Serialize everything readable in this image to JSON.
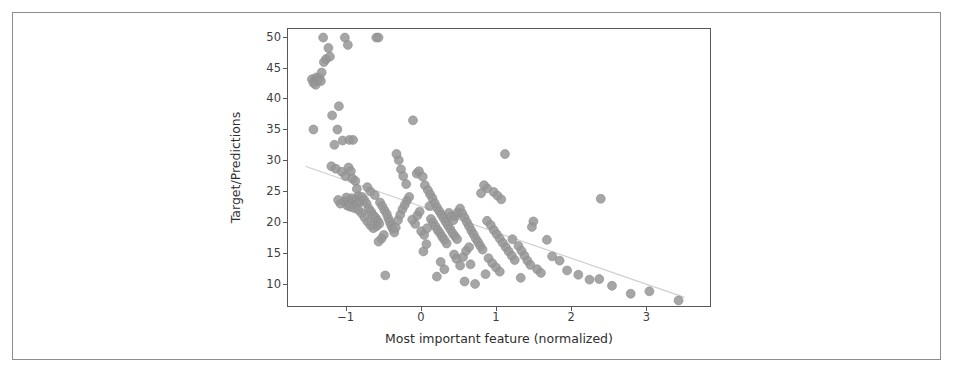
{
  "figure": {
    "background_color": "#ffffff",
    "frame_color": "#8d8d8d",
    "axes_edge_color": "#585858"
  },
  "chart_data": {
    "type": "scatter",
    "title": "",
    "xlabel": "Most important feature (normalized)",
    "ylabel": "Target/Predictions",
    "xlim": [
      -1.78,
      3.86
    ],
    "ylim": [
      6.2,
      51.4
    ],
    "xticks": [
      -1,
      0,
      1,
      2,
      3
    ],
    "xtick_labels": [
      "−1",
      "0",
      "1",
      "2",
      "3"
    ],
    "yticks": [
      10,
      15,
      20,
      25,
      30,
      35,
      40,
      45,
      50
    ],
    "ytick_labels": [
      "10",
      "15",
      "20",
      "25",
      "30",
      "35",
      "40",
      "45",
      "50"
    ],
    "grid": false,
    "legend": null,
    "marker": {
      "shape": "circle",
      "color": "#979797",
      "edge_color": "#8a8a8a",
      "size_px": 9,
      "opacity": 0.85
    },
    "trendline": {
      "type": "line",
      "color": "#cfcfcf",
      "width_px": 1.2,
      "x": [
        -1.55,
        3.52
      ],
      "y": [
        29.0,
        7.6
      ]
    },
    "series": [
      {
        "name": "Target/Predictions",
        "points": [
          [
            -1.44,
            35.0
          ],
          [
            -1.46,
            43.2
          ],
          [
            -1.44,
            42.6
          ],
          [
            -1.42,
            43.1
          ],
          [
            -1.4,
            43.5
          ],
          [
            -1.41,
            42.3
          ],
          [
            -1.38,
            43.0
          ],
          [
            -1.36,
            43.4
          ],
          [
            -1.34,
            42.9
          ],
          [
            -1.33,
            44.3
          ],
          [
            -1.3,
            46.0
          ],
          [
            -1.27,
            46.5
          ],
          [
            -1.31,
            50.0
          ],
          [
            -1.24,
            48.3
          ],
          [
            -1.22,
            46.9
          ],
          [
            -1.19,
            37.3
          ],
          [
            -1.16,
            32.5
          ],
          [
            -1.12,
            35.0
          ],
          [
            -1.1,
            38.8
          ],
          [
            -1.05,
            33.2
          ],
          [
            -1.02,
            50.0
          ],
          [
            -0.98,
            48.8
          ],
          [
            -0.96,
            33.3
          ],
          [
            -0.91,
            33.3
          ],
          [
            -1.2,
            29.0
          ],
          [
            -1.14,
            28.6
          ],
          [
            -1.06,
            28.1
          ],
          [
            -1.01,
            27.4
          ],
          [
            -0.97,
            28.8
          ],
          [
            -0.94,
            28.2
          ],
          [
            -0.92,
            27.0
          ],
          [
            -0.88,
            26.6
          ],
          [
            -0.86,
            25.3
          ],
          [
            -0.84,
            24.1
          ],
          [
            -0.88,
            23.6
          ],
          [
            -0.93,
            23.8
          ],
          [
            -0.97,
            23.4
          ],
          [
            -1.0,
            23.9
          ],
          [
            -1.03,
            23.2
          ],
          [
            -0.99,
            22.6
          ],
          [
            -0.95,
            22.4
          ],
          [
            -0.9,
            22.2
          ],
          [
            -0.86,
            22.8
          ],
          [
            -0.82,
            23.2
          ],
          [
            -0.79,
            24.0
          ],
          [
            -0.76,
            23.5
          ],
          [
            -0.73,
            22.9
          ],
          [
            -0.7,
            22.1
          ],
          [
            -0.67,
            21.6
          ],
          [
            -0.64,
            21.0
          ],
          [
            -0.61,
            20.6
          ],
          [
            -0.58,
            20.1
          ],
          [
            -0.56,
            19.6
          ],
          [
            -0.6,
            19.2
          ],
          [
            -0.64,
            18.9
          ],
          [
            -0.68,
            19.4
          ],
          [
            -0.72,
            20.0
          ],
          [
            -0.76,
            20.7
          ],
          [
            -0.8,
            21.4
          ],
          [
            -0.84,
            21.9
          ],
          [
            -0.55,
            23.1
          ],
          [
            -0.52,
            22.5
          ],
          [
            -0.49,
            21.8
          ],
          [
            -0.46,
            21.2
          ],
          [
            -0.44,
            20.5
          ],
          [
            -0.42,
            19.9
          ],
          [
            -0.4,
            19.3
          ],
          [
            -0.38,
            18.8
          ],
          [
            -0.36,
            18.2
          ],
          [
            -0.34,
            19.0
          ],
          [
            -0.31,
            20.2
          ],
          [
            -0.28,
            21.1
          ],
          [
            -0.25,
            22.0
          ],
          [
            -0.22,
            22.7
          ],
          [
            -0.19,
            23.4
          ],
          [
            -0.16,
            24.0
          ],
          [
            -0.3,
            30.0
          ],
          [
            -0.27,
            28.5
          ],
          [
            -0.24,
            27.4
          ],
          [
            -0.2,
            26.1
          ],
          [
            -0.33,
            31.0
          ],
          [
            -0.11,
            36.5
          ],
          [
            -0.06,
            27.8
          ],
          [
            -0.03,
            28.2
          ],
          [
            0.02,
            27.3
          ],
          [
            0.05,
            25.9
          ],
          [
            0.09,
            25.1
          ],
          [
            0.12,
            24.4
          ],
          [
            0.15,
            23.8
          ],
          [
            0.18,
            23.0
          ],
          [
            0.21,
            22.3
          ],
          [
            0.24,
            21.7
          ],
          [
            0.27,
            21.1
          ],
          [
            0.3,
            20.5
          ],
          [
            0.33,
            19.9
          ],
          [
            0.36,
            19.3
          ],
          [
            0.39,
            18.7
          ],
          [
            0.42,
            18.1
          ],
          [
            0.45,
            17.6
          ],
          [
            0.48,
            17.1
          ],
          [
            0.13,
            20.4
          ],
          [
            0.16,
            19.8
          ],
          [
            0.19,
            19.2
          ],
          [
            0.22,
            18.6
          ],
          [
            0.25,
            18.1
          ],
          [
            0.28,
            17.5
          ],
          [
            0.31,
            17.0
          ],
          [
            0.34,
            16.4
          ],
          [
            0.37,
            21.4
          ],
          [
            0.4,
            20.8
          ],
          [
            0.43,
            20.2
          ],
          [
            0.46,
            20.9
          ],
          [
            0.49,
            21.5
          ],
          [
            0.52,
            22.1
          ],
          [
            0.55,
            21.3
          ],
          [
            0.58,
            20.6
          ],
          [
            0.61,
            19.9
          ],
          [
            0.64,
            19.2
          ],
          [
            0.67,
            18.5
          ],
          [
            0.7,
            17.9
          ],
          [
            0.73,
            17.2
          ],
          [
            0.76,
            16.6
          ],
          [
            0.79,
            16.0
          ],
          [
            0.82,
            15.4
          ],
          [
            0.44,
            14.6
          ],
          [
            0.47,
            13.9
          ],
          [
            0.52,
            12.8
          ],
          [
            0.56,
            14.2
          ],
          [
            0.6,
            15.2
          ],
          [
            0.64,
            15.8
          ],
          [
            0.31,
            12.2
          ],
          [
            0.26,
            13.4
          ],
          [
            0.21,
            11.0
          ],
          [
            -0.48,
            11.2
          ],
          [
            0.03,
            15.1
          ],
          [
            0.07,
            16.3
          ],
          [
            0.88,
            20.1
          ],
          [
            0.93,
            19.4
          ],
          [
            0.97,
            18.6
          ],
          [
            1.01,
            17.9
          ],
          [
            1.05,
            17.2
          ],
          [
            1.09,
            16.5
          ],
          [
            1.13,
            15.8
          ],
          [
            1.17,
            15.1
          ],
          [
            1.21,
            14.4
          ],
          [
            1.25,
            13.7
          ],
          [
            0.9,
            14.0
          ],
          [
            0.95,
            13.2
          ],
          [
            1.0,
            12.5
          ],
          [
            1.05,
            11.8
          ],
          [
            0.86,
            11.4
          ],
          [
            1.3,
            16.0
          ],
          [
            1.34,
            15.2
          ],
          [
            1.38,
            14.4
          ],
          [
            1.42,
            13.6
          ],
          [
            1.46,
            12.9
          ],
          [
            1.5,
            20.0
          ],
          [
            1.48,
            19.1
          ],
          [
            1.12,
            31.0
          ],
          [
            1.22,
            17.1
          ],
          [
            0.97,
            24.8
          ],
          [
            1.02,
            24.2
          ],
          [
            1.07,
            23.6
          ],
          [
            0.88,
            25.4
          ],
          [
            0.84,
            25.9
          ],
          [
            0.8,
            24.6
          ],
          [
            1.55,
            12.2
          ],
          [
            1.6,
            11.6
          ],
          [
            1.75,
            14.3
          ],
          [
            1.85,
            13.6
          ],
          [
            1.95,
            12.0
          ],
          [
            2.1,
            11.3
          ],
          [
            2.25,
            10.5
          ],
          [
            2.4,
            23.7
          ],
          [
            2.38,
            10.6
          ],
          [
            2.55,
            9.5
          ],
          [
            2.8,
            8.2
          ],
          [
            3.05,
            8.6
          ],
          [
            3.44,
            7.1
          ],
          [
            1.68,
            17.0
          ],
          [
            0.58,
            10.2
          ],
          [
            0.72,
            9.8
          ],
          [
            0.66,
            13.0
          ],
          [
            1.33,
            10.8
          ],
          [
            -0.68,
            24.9
          ],
          [
            -0.72,
            25.6
          ],
          [
            -0.62,
            24.3
          ],
          [
            -1.08,
            22.9
          ],
          [
            -1.11,
            23.5
          ],
          [
            -0.5,
            17.8
          ],
          [
            -0.53,
            17.2
          ],
          [
            -0.57,
            16.7
          ],
          [
            0.0,
            18.4
          ],
          [
            0.04,
            17.8
          ],
          [
            0.08,
            18.9
          ],
          [
            -0.08,
            19.6
          ],
          [
            -0.12,
            20.3
          ],
          [
            -0.05,
            21.0
          ],
          [
            -0.02,
            21.6
          ],
          [
            0.11,
            22.5
          ],
          [
            -0.6,
            50.0
          ],
          [
            -0.57,
            50.0
          ]
        ]
      }
    ]
  },
  "axis_title_color": "#2e2e2e",
  "tick_label_color": "#3d3d3d"
}
